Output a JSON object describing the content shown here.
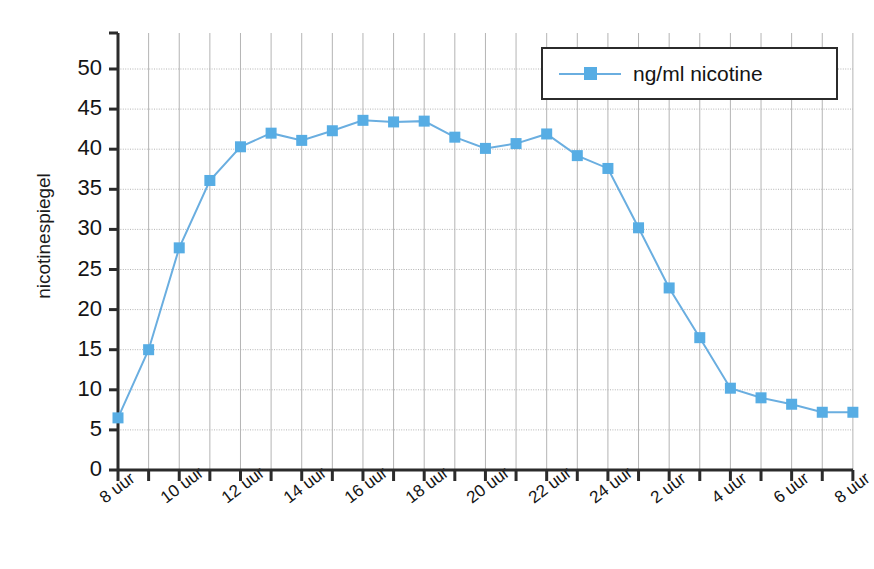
{
  "chart_data": {
    "type": "line",
    "title": "",
    "xlabel": "",
    "ylabel": "nicotinespiegel",
    "ylim": [
      0,
      52
    ],
    "yticks": [
      0,
      5,
      10,
      15,
      20,
      25,
      30,
      35,
      40,
      45,
      50
    ],
    "grid": true,
    "legend_position": "top-right",
    "series": [
      {
        "name": "ng/ml nicotine",
        "color": "#57ade4",
        "marker": "square",
        "x": [
          8,
          9,
          10,
          11,
          12,
          13,
          14,
          15,
          16,
          17,
          18,
          19,
          20,
          21,
          22,
          23,
          24,
          25,
          26,
          27,
          28,
          29,
          30,
          31,
          32
        ],
        "categories": [
          "8 uur",
          "9 uur",
          "10 uur",
          "11 uur",
          "12 uur",
          "13 uur",
          "14 uur",
          "15 uur",
          "16 uur",
          "17 uur",
          "18 uur",
          "19 uur",
          "20 uur",
          "21 uur",
          "22 uur",
          "23 uur",
          "24 uur",
          "1 uur",
          "2 uur",
          "3 uur",
          "4 uur",
          "5 uur",
          "6 uur",
          "7 uur",
          "8 uur"
        ],
        "values": [
          6.5,
          15.0,
          27.7,
          36.1,
          40.3,
          42.0,
          41.1,
          42.3,
          43.6,
          43.4,
          43.5,
          41.5,
          40.1,
          40.7,
          41.9,
          39.2,
          37.6,
          30.2,
          22.7,
          16.5,
          10.2,
          9.0,
          8.2,
          7.2,
          7.2
        ]
      }
    ],
    "xtick_labels": [
      "8 uur",
      "10 uur",
      "12 uur",
      "14 uur",
      "16 uur",
      "18 uur",
      "20 uur",
      "22 uur",
      "24 uur",
      "2 uur",
      "4 uur",
      "6 uur",
      "8 uur"
    ],
    "xtick_indices": [
      0,
      2,
      4,
      6,
      8,
      10,
      12,
      14,
      16,
      18,
      20,
      22,
      24
    ]
  },
  "legend": {
    "label": "ng/ml nicotine"
  },
  "axis": {
    "y_title": "nicotinespiegel"
  },
  "colors": {
    "line": "#6aaee0",
    "marker": "#57ade4",
    "axis": "#2b2b2b",
    "grid": "#b4b4b4"
  }
}
